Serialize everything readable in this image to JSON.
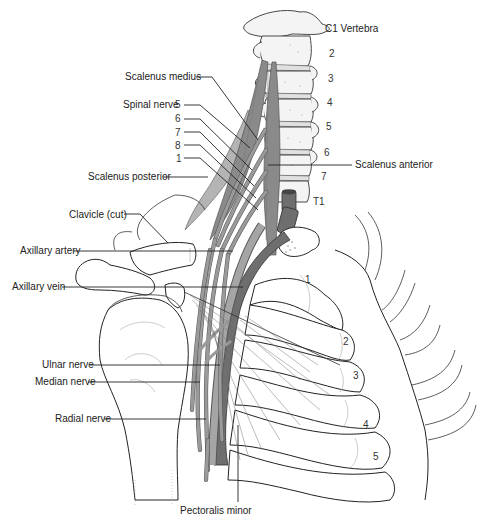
{
  "figure": {
    "colors": {
      "background": "#ffffff",
      "line": "#222222",
      "muscle": "#8a8a8a",
      "vein": "#6e6e6e",
      "nerve": "#9a9a9a",
      "bone": "#f4f4f4"
    }
  },
  "labels_left": {
    "scalenus_medius": "Scalenus medius",
    "spinal_nerve": "Spinal nerve",
    "scalenus_posterior": "Scalenus posterior",
    "clavicle_cut": "Clavicle (cut)",
    "axillary_artery": "Axillary artery",
    "axillary_vein": "Axillary vein",
    "ulnar_nerve": "Ulnar nerve",
    "median_nerve": "Median nerve",
    "radial_nerve": "Radial nerve"
  },
  "spinal_nerve_numbers": [
    "5",
    "6",
    "7",
    "8",
    "1"
  ],
  "labels_right": {
    "c1_vertebra": "C1 Vertebra",
    "scalenus_anterior": "Scalenus anterior"
  },
  "vertebra_numbers": [
    "2",
    "3",
    "4",
    "5",
    "6",
    "7",
    "T1"
  ],
  "labels_bottom": {
    "pectoralis_minor": "Pectoralis minor"
  },
  "rib_numbers": [
    "1",
    "2",
    "3",
    "4",
    "5"
  ]
}
